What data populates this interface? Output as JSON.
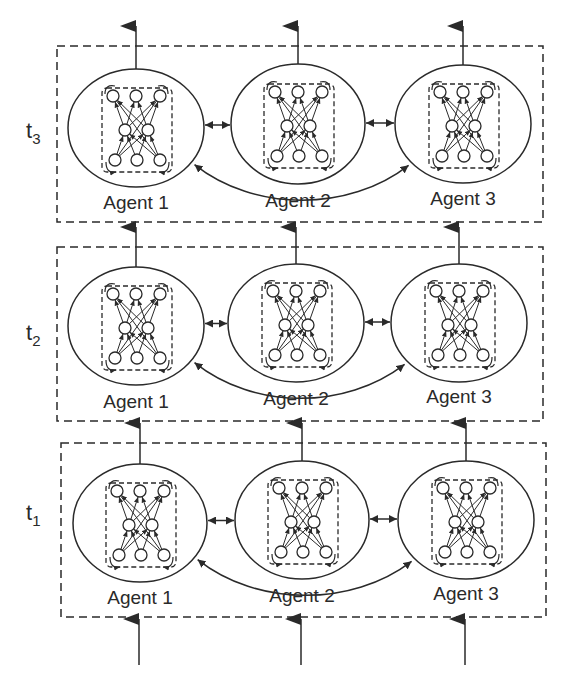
{
  "diagram": {
    "colors": {
      "stroke": "#2a2a2a",
      "background": "#ffffff"
    },
    "agent_labels": [
      "Agent 1",
      "Agent 2",
      "Agent 3"
    ],
    "time_steps": [
      {
        "id": "t3",
        "label": "t",
        "subscript": "3",
        "label_pos": [
          56,
          138
        ],
        "box": {
          "x": 57,
          "y": 46,
          "w": 486,
          "h": 176
        },
        "agents": [
          {
            "name": "Agent 1",
            "cx": 136,
            "cy": 128,
            "rx": 68,
            "ry": 59,
            "label_y": 209
          },
          {
            "name": "Agent 2",
            "cx": 298,
            "cy": 124,
            "rx": 67,
            "ry": 60,
            "label_y": 207
          },
          {
            "name": "Agent 3",
            "cx": 463,
            "cy": 124,
            "rx": 68,
            "ry": 59,
            "label_y": 205
          }
        ]
      },
      {
        "id": "t2",
        "label": "t",
        "subscript": "2",
        "label_pos": [
          56,
          340
        ],
        "box": {
          "x": 57,
          "y": 247,
          "w": 486,
          "h": 174
        },
        "agents": [
          {
            "name": "Agent 1",
            "cx": 136,
            "cy": 326,
            "rx": 68,
            "ry": 59,
            "label_y": 408
          },
          {
            "name": "Agent 2",
            "cx": 296,
            "cy": 323,
            "rx": 68,
            "ry": 59,
            "label_y": 405
          },
          {
            "name": "Agent 3",
            "cx": 459,
            "cy": 323,
            "rx": 68,
            "ry": 59,
            "label_y": 403
          }
        ]
      },
      {
        "id": "t1",
        "label": "t",
        "subscript": "1",
        "label_pos": [
          56,
          520
        ],
        "box": {
          "x": 61,
          "y": 443,
          "w": 485,
          "h": 174
        },
        "agents": [
          {
            "name": "Agent 1",
            "cx": 140,
            "cy": 523,
            "rx": 67,
            "ry": 59,
            "label_y": 604
          },
          {
            "name": "Agent 2",
            "cx": 302,
            "cy": 520,
            "rx": 67,
            "ry": 59,
            "label_y": 602
          },
          {
            "name": "Agent 3",
            "cx": 466,
            "cy": 520,
            "rx": 68,
            "ry": 59,
            "label_y": 600
          }
        ]
      }
    ],
    "connections": {
      "between_timesteps": "vertical arrows from each agent upward to the same agent at next time step",
      "lateral": "bidirectional arrows between adjacent agents",
      "skip": "curved bidirectional arrow between Agent 1 and Agent 3 passing under Agent 2",
      "inputs": "upward arrows into each agent at t1",
      "outputs": "upward arrows out of each agent at t3"
    },
    "network": {
      "layers": [
        3,
        2,
        3
      ],
      "recurrent_loops": "dashed box around network with feedback loops on outer nodes"
    }
  }
}
